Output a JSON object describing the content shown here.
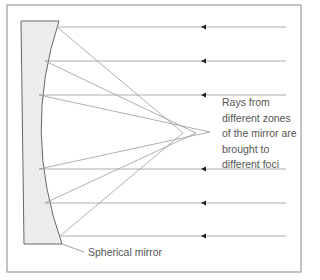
{
  "diagram": {
    "annotation_lines": [
      "Rays from",
      "different zones",
      "of the mirror are",
      "brought to",
      "different foci"
    ],
    "mirror_label": "Spherical mirror",
    "colors": {
      "frame": "#888888",
      "ray": "#9a9a9a",
      "mirror_fill": "#ececec",
      "mirror_stroke": "#666666",
      "arrow": "#222222",
      "text": "#555555"
    },
    "rays": [
      {
        "y": 27,
        "hit_x": 57,
        "focus_x": 183
      },
      {
        "y": 61,
        "hit_x": 45,
        "focus_x": 196
      },
      {
        "y": 95,
        "hit_x": 39,
        "focus_x": 210
      },
      {
        "y": 169,
        "hit_x": 39,
        "focus_x": 210
      },
      {
        "y": 203,
        "hit_x": 45,
        "focus_x": 196
      },
      {
        "y": 236,
        "hit_x": 60,
        "focus_x": 183
      }
    ]
  }
}
